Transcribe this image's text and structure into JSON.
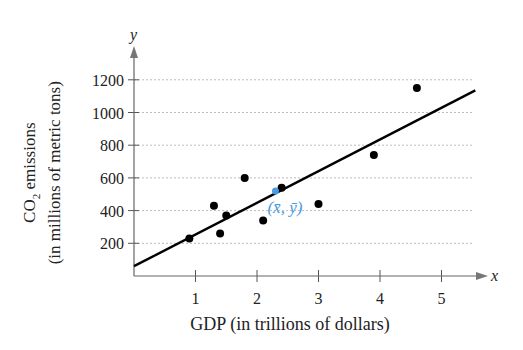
{
  "chart_data": {
    "type": "scatter",
    "title": "",
    "xlabel": "GDP (in trillions of dollars)",
    "ylabel_line1": "CO2 emissions",
    "ylabel_line2": "(in millions of metric tons)",
    "x_axis_symbol": "x",
    "y_axis_symbol": "y",
    "x_ticks": [
      1,
      2,
      3,
      4,
      5
    ],
    "y_ticks": [
      200,
      400,
      600,
      800,
      1000,
      1200
    ],
    "xlim": [
      0,
      5.5
    ],
    "ylim": [
      0,
      1300
    ],
    "grid": "horizontal dotted",
    "series": [
      {
        "name": "data points",
        "x": [
          0.9,
          1.3,
          1.4,
          1.5,
          1.8,
          2.1,
          2.4,
          3.0,
          3.9,
          4.6
        ],
        "y": [
          230,
          430,
          260,
          370,
          600,
          340,
          540,
          440,
          740,
          1150
        ]
      }
    ],
    "regression_line": {
      "x": [
        0,
        5.55
      ],
      "y": [
        60,
        1135
      ]
    },
    "annotation": {
      "label": "(x̄, ȳ)",
      "x": 2.3,
      "y": 520,
      "color": "#4a9be0"
    }
  }
}
